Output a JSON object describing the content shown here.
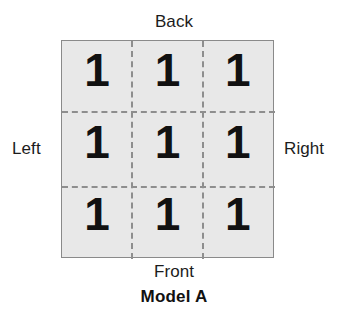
{
  "figure": {
    "caption": "Model A",
    "labels": {
      "back": "Back",
      "front": "Front",
      "left": "Left",
      "right": "Right"
    },
    "colors": {
      "cell_fill": "#e8e8e8",
      "border": "#8a8a8a",
      "dashed_line": "#8e8e8e",
      "digit": "#111111",
      "background": "#ffffff"
    }
  },
  "chart_data": {
    "type": "table",
    "title": "Model A",
    "xlabel": "",
    "ylabel": "",
    "grid": true,
    "rows": 3,
    "columns": 3,
    "orientation_labels": {
      "top": "Back",
      "bottom": "Front",
      "left": "Left",
      "right": "Right"
    },
    "cells": [
      [
        "1",
        "1",
        "1"
      ],
      [
        "1",
        "1",
        "1"
      ],
      [
        "1",
        "1",
        "1"
      ]
    ],
    "values": [
      1,
      1,
      1,
      1,
      1,
      1,
      1,
      1,
      1
    ]
  }
}
